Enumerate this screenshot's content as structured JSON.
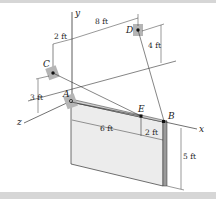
{
  "figure": {
    "axes": {
      "x": "x",
      "y": "y",
      "z": "z"
    },
    "points": {
      "A": "A",
      "B": "B",
      "C": "C",
      "D": "D",
      "E": "E"
    },
    "dimensions": {
      "c_offset_x": "2 ft",
      "d_offset_x": "8 ft",
      "d_height": "4 ft",
      "c_height": "3 ft",
      "ae_length": "6 ft",
      "eb_length": "2 ft",
      "plate_height": "5 ft"
    },
    "colors": {
      "plate_face": "#e9e9e9",
      "plate_edge": "#9a9a9a",
      "bracket": "#b5b5b5",
      "line": "#333333",
      "band": "#d6d6d6"
    }
  }
}
